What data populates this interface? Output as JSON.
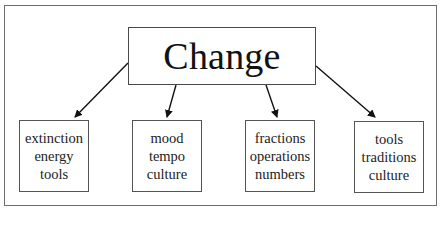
{
  "diagram": {
    "title": "Change",
    "children": [
      {
        "lines": [
          "extinction",
          "energy",
          "tools"
        ]
      },
      {
        "lines": [
          "mood",
          "tempo",
          "culture"
        ]
      },
      {
        "lines": [
          "fractions",
          "operations",
          "numbers"
        ]
      },
      {
        "lines": [
          "tools",
          "traditions",
          "culture"
        ]
      }
    ],
    "colors": {
      "line": "#1a1a1a",
      "border": "#555555",
      "background": "#ffffff"
    }
  }
}
